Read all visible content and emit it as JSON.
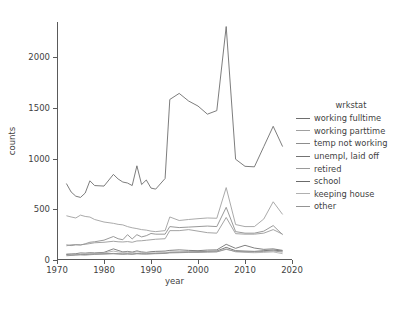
{
  "chart_data": {
    "type": "line",
    "title": "",
    "xlabel": "year",
    "ylabel": "counts",
    "xlim": [
      1970,
      2020
    ],
    "ylim": [
      0,
      2350
    ],
    "xticks": [
      1970,
      1980,
      1990,
      2000,
      2010,
      2020
    ],
    "yticks": [
      0,
      500,
      1000,
      1500,
      2000
    ],
    "grid": false,
    "legend_title": "wrkstat",
    "legend_position": "right",
    "x": [
      1972,
      1973,
      1974,
      1975,
      1976,
      1977,
      1978,
      1980,
      1982,
      1983,
      1984,
      1985,
      1986,
      1987,
      1988,
      1989,
      1990,
      1991,
      1993,
      1994,
      1996,
      1998,
      2000,
      2002,
      2004,
      2006,
      2008,
      2010,
      2012,
      2014,
      2016,
      2018
    ],
    "series": [
      {
        "name": "working fulltime",
        "color": "#6e6e6e",
        "values": [
          755,
          672,
          630,
          618,
          661,
          782,
          735,
          730,
          845,
          800,
          770,
          760,
          735,
          930,
          745,
          790,
          710,
          700,
          805,
          1585,
          1645,
          1570,
          1520,
          1440,
          1475,
          2305,
          995,
          925,
          920,
          1120,
          1320,
          1120
        ]
      },
      {
        "name": "working parttime",
        "color": "#a0a0a0",
        "values": [
          437,
          425,
          415,
          443,
          430,
          424,
          400,
          375,
          362,
          352,
          347,
          330,
          318,
          310,
          300,
          295,
          285,
          280,
          290,
          425,
          390,
          400,
          408,
          415,
          412,
          715,
          350,
          330,
          330,
          405,
          575,
          450
        ]
      },
      {
        "name": "temp not working",
        "color": "#8d8d8d",
        "values": [
          150,
          142,
          150,
          148,
          160,
          175,
          180,
          196,
          232,
          210,
          200,
          250,
          208,
          250,
          228,
          240,
          262,
          255,
          255,
          330,
          320,
          325,
          330,
          335,
          330,
          520,
          280,
          265,
          265,
          285,
          340,
          250
        ]
      },
      {
        "name": "unempl, laid off",
        "color": "#737373",
        "values": [
          58,
          60,
          62,
          70,
          68,
          72,
          70,
          75,
          110,
          95,
          80,
          85,
          78,
          90,
          80,
          75,
          82,
          85,
          88,
          95,
          100,
          95,
          92,
          98,
          100,
          155,
          115,
          145,
          118,
          105,
          110,
          95
        ]
      },
      {
        "name": "retired",
        "color": "#9a9a9a",
        "values": [
          140,
          150,
          152,
          150,
          155,
          162,
          170,
          175,
          185,
          180,
          178,
          182,
          175,
          188,
          190,
          195,
          200,
          205,
          210,
          290,
          290,
          300,
          285,
          270,
          265,
          420,
          260,
          255,
          255,
          265,
          300,
          255
        ]
      },
      {
        "name": "school",
        "color": "#6b6b6b",
        "values": [
          55,
          50,
          52,
          55,
          54,
          58,
          60,
          62,
          62,
          60,
          58,
          60,
          58,
          62,
          60,
          60,
          62,
          65,
          68,
          75,
          78,
          80,
          82,
          85,
          88,
          125,
          92,
          88,
          85,
          92,
          98,
          88
        ]
      },
      {
        "name": "keeping house",
        "color": "#b0b0b0",
        "values": [
          48,
          52,
          55,
          58,
          60,
          62,
          60,
          70,
          88,
          80,
          75,
          78,
          72,
          82,
          75,
          72,
          70,
          70,
          72,
          78,
          78,
          80,
          78,
          80,
          82,
          110,
          80,
          75,
          72,
          75,
          80,
          62
        ]
      },
      {
        "name": "other",
        "color": "#949494",
        "values": [
          42,
          45,
          48,
          50,
          48,
          52,
          55,
          58,
          65,
          62,
          60,
          62,
          58,
          65,
          62,
          60,
          62,
          62,
          65,
          70,
          72,
          75,
          75,
          78,
          80,
          105,
          85,
          82,
          80,
          85,
          90,
          78
        ]
      }
    ]
  }
}
